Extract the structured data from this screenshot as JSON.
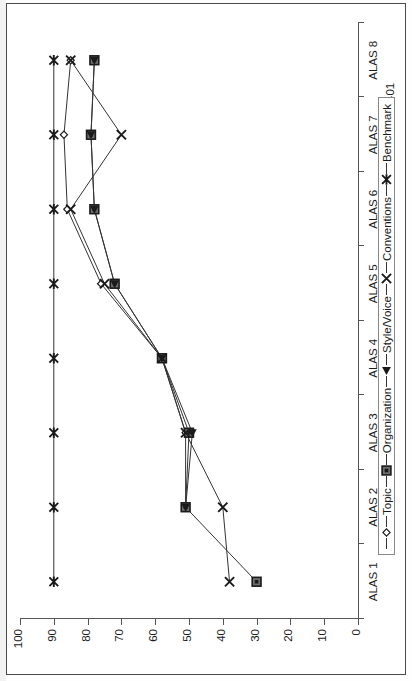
{
  "chart_data": {
    "type": "line",
    "title": "",
    "orientation": "rotated-90",
    "xlabel": "",
    "ylabel": "",
    "ylim": [
      0,
      100
    ],
    "yticks": [
      "0",
      "10",
      "20",
      "30",
      "40",
      "50",
      "60",
      "70",
      "80",
      "90",
      "100"
    ],
    "grid": false,
    "legend_position": "bottom-right",
    "categories": [
      "ALAS 1",
      "ALAS 2",
      "ALAS 3",
      "ALAS 4",
      "ALAS 5",
      "ALAS 6",
      "ALAS 7",
      "ALAS 8"
    ],
    "group_labels": [
      {
        "label": "98-99",
        "span": [
          "ALAS 1",
          "ALAS 2",
          "ALAS 3"
        ]
      },
      {
        "label": "99-00",
        "span": [
          "ALAS 4",
          "ALAS 5",
          "ALAS 6"
        ]
      },
      {
        "label": "00-01",
        "span": [
          "ALAS 7",
          "ALAS 8"
        ]
      }
    ],
    "series": [
      {
        "name": "Topic",
        "marker": "diamond-open",
        "values": [
          null,
          51,
          51,
          58,
          76,
          86,
          87,
          85
        ]
      },
      {
        "name": "Organization",
        "marker": "square-filled",
        "values": [
          30,
          51,
          50,
          58,
          72,
          78,
          79,
          78
        ]
      },
      {
        "name": "Style/Voice",
        "marker": "triangle-left",
        "values": [
          null,
          51,
          49,
          58,
          72,
          78,
          79,
          78
        ]
      },
      {
        "name": "Conventions",
        "marker": "x-cross",
        "values": [
          38,
          40,
          51,
          58,
          75,
          85,
          70,
          85
        ]
      },
      {
        "name": "Benchmark",
        "marker": "asterisk",
        "values": [
          90,
          90,
          90,
          90,
          90,
          90,
          90,
          90
        ]
      }
    ]
  },
  "legend": {
    "entries": [
      {
        "label": "Topic"
      },
      {
        "label": "Organization"
      },
      {
        "label": "Style/Voice"
      },
      {
        "label": "Conventions"
      },
      {
        "label": "Benchmark"
      }
    ]
  },
  "axes": {
    "y_tick_labels": [
      "0",
      "10",
      "20",
      "30",
      "40",
      "50",
      "60",
      "70",
      "80",
      "90",
      "100"
    ],
    "x_tick_labels": [
      "ALAS 1",
      "ALAS 2",
      "ALAS 3",
      "ALAS 4",
      "ALAS 5",
      "ALAS 6",
      "ALAS 7",
      "ALAS 8"
    ],
    "group_tick_labels": [
      "98-99",
      "99-00",
      "00-01"
    ]
  },
  "colors": {
    "axis": "#555555",
    "series_line": "#333333",
    "marker_fill": "#1a1a1a",
    "marker_grey": "#6e6e6e",
    "background": "#ffffff"
  }
}
